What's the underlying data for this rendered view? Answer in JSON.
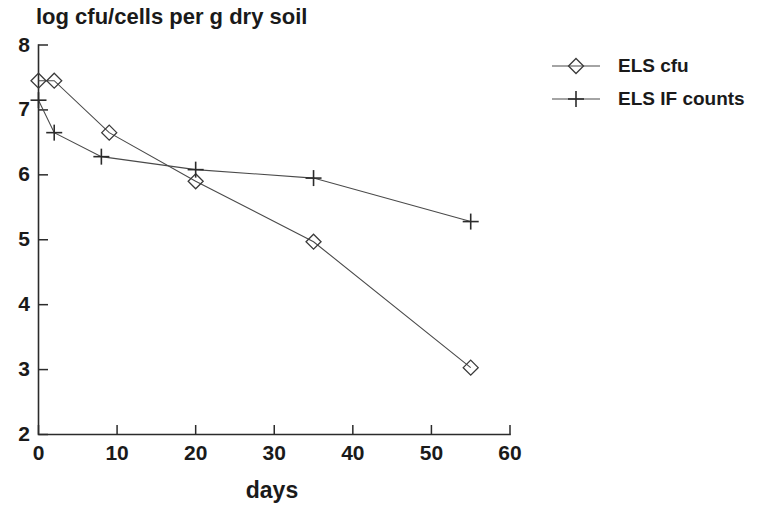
{
  "chart_data": {
    "type": "line",
    "title": "log cfu/cells per g dry soil",
    "subtitle": "",
    "xlabel": "days",
    "ylabel": "",
    "xlim": [
      0,
      60
    ],
    "ylim": [
      2,
      8
    ],
    "xticks": [
      0,
      10,
      20,
      30,
      40,
      50,
      60
    ],
    "yticks": [
      2,
      3,
      4,
      5,
      6,
      7,
      8
    ],
    "xtick_labels": [
      "0",
      "10",
      "20",
      "30",
      "40",
      "50",
      "60"
    ],
    "ytick_labels": [
      "2",
      "3",
      "4",
      "5",
      "6",
      "7",
      "8"
    ],
    "grid": false,
    "legend_position": "right-top",
    "series": [
      {
        "name": "ELS cfu",
        "marker": "diamond",
        "color": "#3a3a3a",
        "x": [
          0,
          2,
          9,
          20,
          35,
          55
        ],
        "y": [
          7.45,
          7.45,
          6.65,
          5.9,
          4.97,
          3.03
        ]
      },
      {
        "name": "ELS IF counts",
        "marker": "plus",
        "color": "#2b2b2b",
        "x": [
          0,
          2,
          8,
          20,
          35,
          55
        ],
        "y": [
          7.15,
          6.65,
          6.28,
          6.08,
          5.95,
          5.28
        ]
      }
    ]
  },
  "legend": {
    "entries": [
      {
        "label": "ELS cfu",
        "marker": "diamond"
      },
      {
        "label": "ELS IF counts",
        "marker": "plus"
      }
    ]
  },
  "colors": {
    "background": "#ffffff",
    "axis": "#2b2b2b",
    "series_cfu": "#3a3a3a",
    "series_if": "#2b2b2b",
    "text": "#1a1a1a"
  }
}
